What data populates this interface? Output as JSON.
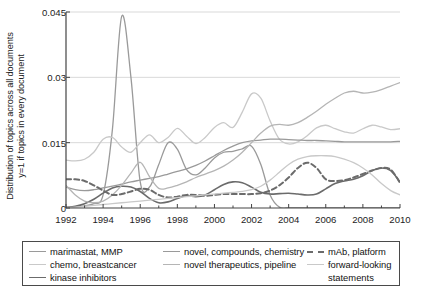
{
  "chart_data": {
    "type": "line",
    "title": "",
    "xlabel": "",
    "ylabel": "Distribution of topics across all documents y=1 if topics in every document",
    "ylabel_line1": "Distribution of topics across all documents",
    "ylabel_line2": "y=1 if topics in every document",
    "xlim": [
      1992,
      2010
    ],
    "ylim": [
      0,
      0.045
    ],
    "xticks": [
      1992,
      1994,
      1996,
      1998,
      2000,
      2002,
      2004,
      2006,
      2008,
      2010
    ],
    "xtick_labels": [
      "1992",
      "1994",
      "1996",
      "1998",
      "2000",
      "2002",
      "2004",
      "2006",
      "2008",
      "2010"
    ],
    "xminor_step": 1,
    "yticks": [
      0,
      0.015,
      0.03,
      0.045
    ],
    "ytick_labels": [
      "0",
      "0.015",
      "0.03",
      "0.045"
    ],
    "grid": "horizontal",
    "grid_color": "#d9d9d9",
    "legend_position": "below-plot",
    "x": [
      1992,
      1992.5,
      1993,
      1993.5,
      1994,
      1994.5,
      1995,
      1995.5,
      1996,
      1996.5,
      1997,
      1997.5,
      1998,
      1998.5,
      1999,
      1999.5,
      2000,
      2000.5,
      2001,
      2001.5,
      2002,
      2002.5,
      2003,
      2003.5,
      2004,
      2004.5,
      2005,
      2005.5,
      2006,
      2006.5,
      2007,
      2007.5,
      2008,
      2008.5,
      2009,
      2009.5,
      2010
    ],
    "series": [
      {
        "name": "marimastat, MMP",
        "color": "#9a9a9a",
        "style": "solid",
        "width": 1.3,
        "values": [
          0.0002,
          0.0003,
          0.0005,
          0.001,
          0.003,
          0.018,
          0.044,
          0.03,
          0.006,
          0.0048,
          0.01,
          0.015,
          0.0135,
          0.0088,
          0.0076,
          0.0092,
          0.0115,
          0.0128,
          0.013,
          0.0136,
          0.0142,
          0.01,
          0.003,
          0.0002,
          0.0001,
          0.0001,
          0.0001,
          0.0001,
          0.0001,
          0.0001,
          0.0001,
          0.0001,
          0.0001,
          0.0001,
          0.0001,
          0.0001,
          0.0001
        ]
      },
      {
        "name": "chemo, breastcancer",
        "color": "#c9c9c9",
        "style": "solid",
        "width": 1.3,
        "values": [
          0.011,
          0.0108,
          0.0112,
          0.0128,
          0.0158,
          0.0162,
          0.014,
          0.0128,
          0.015,
          0.0168,
          0.015,
          0.0162,
          0.0183,
          0.0165,
          0.0148,
          0.0162,
          0.0185,
          0.0196,
          0.0185,
          0.022,
          0.0262,
          0.0252,
          0.02,
          0.0158,
          0.0147,
          0.0152,
          0.0166,
          0.0184,
          0.019,
          0.0182,
          0.0175,
          0.0172,
          0.0182,
          0.019,
          0.0186,
          0.018,
          0.0182
        ]
      },
      {
        "name": "kinase inhibitors",
        "color": "#6b6b6b",
        "style": "solid",
        "width": 1.6,
        "values": [
          0.0001,
          0.0004,
          0.001,
          0.002,
          0.0034,
          0.0046,
          0.005,
          0.0048,
          0.0038,
          0.0022,
          0.0012,
          0.0014,
          0.0022,
          0.0028,
          0.0026,
          0.003,
          0.0042,
          0.0054,
          0.006,
          0.0058,
          0.0048,
          0.0036,
          0.0032,
          0.0033,
          0.0034,
          0.0032,
          0.003,
          0.0032,
          0.0044,
          0.0056,
          0.0062,
          0.0066,
          0.0074,
          0.0086,
          0.0092,
          0.0086,
          0.006
        ]
      },
      {
        "name": "novel, compounds, chemistry",
        "color": "#9a9a9a",
        "style": "solid",
        "width": 1.3,
        "values": [
          0.0048,
          0.0042,
          0.004,
          0.0042,
          0.0046,
          0.005,
          0.0055,
          0.006,
          0.0064,
          0.0068,
          0.0072,
          0.0078,
          0.0084,
          0.009,
          0.0098,
          0.0108,
          0.012,
          0.0132,
          0.0142,
          0.015,
          0.0154,
          0.0156,
          0.0158,
          0.0158,
          0.0157,
          0.0156,
          0.0155,
          0.0155,
          0.0154,
          0.0153,
          0.0152,
          0.0152,
          0.0152,
          0.0152,
          0.0152,
          0.0152,
          0.0153
        ]
      },
      {
        "name": "novel therapeutics, pipeline",
        "color": "#b5b5b5",
        "style": "solid",
        "width": 1.3,
        "values": [
          0.0052,
          0.003,
          0.0016,
          0.0012,
          0.0016,
          0.003,
          0.0052,
          0.008,
          0.0105,
          0.0072,
          0.0045,
          0.0046,
          0.0052,
          0.006,
          0.007,
          0.0078,
          0.0086,
          0.0096,
          0.011,
          0.0128,
          0.015,
          0.0172,
          0.0188,
          0.0192,
          0.019,
          0.0196,
          0.0208,
          0.0222,
          0.0238,
          0.0252,
          0.0264,
          0.0268,
          0.0264,
          0.0266,
          0.0272,
          0.028,
          0.0288
        ]
      },
      {
        "name": "mAb, platform",
        "color": "#6b6b6b",
        "style": "dashed",
        "width": 2.0,
        "values": [
          0.0066,
          0.0066,
          0.0062,
          0.0052,
          0.004,
          0.003,
          0.0032,
          0.0038,
          0.0044,
          0.0042,
          0.003,
          0.0024,
          0.0026,
          0.003,
          0.003,
          0.0028,
          0.003,
          0.0032,
          0.0032,
          0.0032,
          0.0032,
          0.0034,
          0.004,
          0.0052,
          0.007,
          0.0092,
          0.0104,
          0.0092,
          0.0066,
          0.0062,
          0.0064,
          0.007,
          0.0078,
          0.0086,
          0.0092,
          0.0088,
          0.0058
        ]
      },
      {
        "name": "forward-looking statements",
        "color": "#c9c9c9",
        "style": "solid",
        "width": 1.3,
        "values": [
          0.0001,
          0.0002,
          0.0004,
          0.0006,
          0.0008,
          0.001,
          0.0012,
          0.0014,
          0.0016,
          0.0018,
          0.002,
          0.0022,
          0.0024,
          0.0026,
          0.0028,
          0.003,
          0.0032,
          0.0034,
          0.0036,
          0.0038,
          0.0042,
          0.005,
          0.0064,
          0.0082,
          0.01,
          0.0112,
          0.0118,
          0.012,
          0.012,
          0.0118,
          0.0112,
          0.0104,
          0.0092,
          0.0076,
          0.0056,
          0.004,
          0.003
        ]
      }
    ]
  },
  "legend": {
    "columns": [
      {
        "items": [
          {
            "label": "marimastat, MMP",
            "color": "#9a9a9a",
            "style": "solid"
          },
          {
            "label": "chemo, breastcancer",
            "color": "#c9c9c9",
            "style": "solid"
          },
          {
            "label": "kinase inhibitors",
            "color": "#6b6b6b",
            "style": "solid"
          }
        ]
      },
      {
        "items": [
          {
            "label": "novel, compounds, chemistry",
            "color": "#9a9a9a",
            "style": "solid"
          },
          {
            "label": "novel therapeutics, pipeline",
            "color": "#b5b5b5",
            "style": "solid"
          }
        ]
      },
      {
        "items": [
          {
            "label": "mAb, platform",
            "color": "#6b6b6b",
            "style": "dashed"
          },
          {
            "label": "forward-looking",
            "label2": "statements",
            "color": "#c9c9c9",
            "style": "solid"
          }
        ]
      }
    ]
  }
}
